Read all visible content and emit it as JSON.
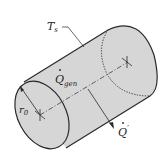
{
  "diagram": {
    "labels": {
      "surface_temp": "T",
      "surface_temp_sub": "s",
      "heat_gen": "Q",
      "heat_gen_sub": "gen",
      "heat_out": "Q",
      "heat_out_prime": "′",
      "radius": "r",
      "radius_sub": "0"
    },
    "colors": {
      "fill": "#d6d6d6",
      "stroke": "#2a2a2a",
      "background": "#ffffff"
    }
  }
}
